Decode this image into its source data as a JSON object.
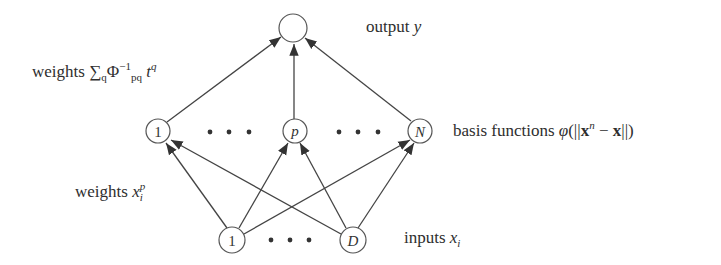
{
  "diagram": {
    "type": "neural-network",
    "title": "",
    "colors": {
      "stroke": "#444444",
      "text": "#2e2e2e",
      "background": "#ffffff"
    },
    "layers": {
      "output": {
        "label_prefix": "output ",
        "label_var": "y",
        "nodes": [
          {
            "id": "out",
            "label": ""
          }
        ]
      },
      "hidden": {
        "label_prefix": "basis functions ",
        "label_formula": {
          "phi": "φ",
          "open": "(||",
          "x_bold": "x",
          "sup": "n",
          "minus": " − ",
          "x2_bold": "x",
          "close": "||)"
        },
        "nodes": [
          {
            "id": "h1",
            "label": "1"
          },
          {
            "id": "hp",
            "label": "p"
          },
          {
            "id": "hN",
            "label": "N"
          }
        ],
        "ellipsis": "• • •"
      },
      "input": {
        "label_prefix": "inputs ",
        "label_var": "x",
        "label_sub": "i",
        "nodes": [
          {
            "id": "i1",
            "label": "1"
          },
          {
            "id": "iD",
            "label": "D"
          }
        ],
        "ellipsis": "• • •"
      }
    },
    "weights": {
      "top": {
        "prefix": "weights ",
        "sigma": "∑",
        "sigma_sub": "q",
        "phi": "Φ",
        "phi_sup": "−1",
        "phi_sub": "pq",
        "t": "t",
        "t_sup": "q"
      },
      "bottom": {
        "prefix": "weights ",
        "var": "x",
        "sub": "i",
        "sup": "p"
      }
    },
    "edges": [
      {
        "from": "h1",
        "to": "out"
      },
      {
        "from": "hp",
        "to": "out"
      },
      {
        "from": "hN",
        "to": "out"
      },
      {
        "from": "i1",
        "to": "h1"
      },
      {
        "from": "i1",
        "to": "hp"
      },
      {
        "from": "i1",
        "to": "hN"
      },
      {
        "from": "iD",
        "to": "h1"
      },
      {
        "from": "iD",
        "to": "hp"
      },
      {
        "from": "iD",
        "to": "hN"
      }
    ]
  }
}
